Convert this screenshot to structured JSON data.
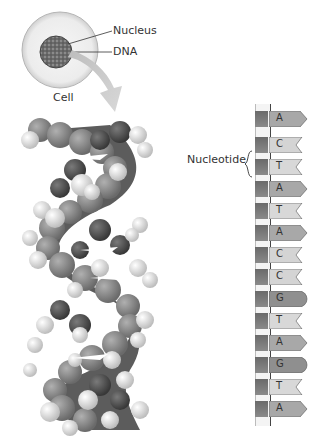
{
  "cell_diagram": {
    "nucleus_label": "Nucleus",
    "dna_label": "DNA",
    "cell_label": "Cell"
  },
  "strand": {
    "nucleotide_label": "Nucleotide",
    "bases": [
      {
        "letter": "A",
        "shape": "arrow",
        "color": "#a8a8a8",
        "top": 111
      },
      {
        "letter": "C",
        "shape": "notch",
        "color": "#d4d4d4",
        "top": 137
      },
      {
        "letter": "T",
        "shape": "notch",
        "color": "#d8d8d8",
        "top": 159
      },
      {
        "letter": "A",
        "shape": "arrow",
        "color": "#a8a8a8",
        "top": 181
      },
      {
        "letter": "T",
        "shape": "notch",
        "color": "#d8d8d8",
        "top": 203
      },
      {
        "letter": "A",
        "shape": "arrow",
        "color": "#a8a8a8",
        "top": 225
      },
      {
        "letter": "C",
        "shape": "notch",
        "color": "#d4d4d4",
        "top": 247
      },
      {
        "letter": "C",
        "shape": "notch",
        "color": "#d4d4d4",
        "top": 269
      },
      {
        "letter": "G",
        "shape": "round",
        "color": "#8f8f8f",
        "top": 291
      },
      {
        "letter": "T",
        "shape": "notch",
        "color": "#d8d8d8",
        "top": 313
      },
      {
        "letter": "A",
        "shape": "arrow",
        "color": "#a8a8a8",
        "top": 335
      },
      {
        "letter": "G",
        "shape": "round",
        "color": "#8f8f8f",
        "top": 357
      },
      {
        "letter": "T",
        "shape": "notch",
        "color": "#d8d8d8",
        "top": 379
      },
      {
        "letter": "A",
        "shape": "arrow",
        "color": "#a8a8a8",
        "top": 401
      }
    ]
  }
}
